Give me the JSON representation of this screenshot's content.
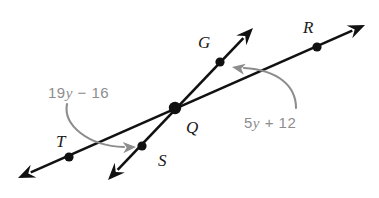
{
  "figure": {
    "type": "geometry-diagram",
    "background_color": "#ffffff"
  },
  "colors": {
    "line": "#111111",
    "point": "#111111",
    "point_label": "#1a1a1a",
    "angle_arc": "#8d8d8d",
    "angle_label": "#8d8d8d"
  },
  "points": [
    {
      "id": "G",
      "label": "G",
      "label_x": 198,
      "label_y": 48,
      "dot_x": 220,
      "dot_y": 62,
      "dot_r": 4.6
    },
    {
      "id": "R",
      "label": "R",
      "label_x": 303,
      "label_y": 33,
      "dot_x": 317,
      "dot_y": 47,
      "dot_r": 4.6
    },
    {
      "id": "Q",
      "label": "Q",
      "label_x": 186,
      "label_y": 133,
      "dot_x": 175,
      "dot_y": 108,
      "dot_r": 6.2
    },
    {
      "id": "T",
      "label": "T",
      "label_x": 56,
      "label_y": 147,
      "dot_x": 69,
      "dot_y": 157,
      "dot_r": 4.6
    },
    {
      "id": "S",
      "label": "S",
      "label_x": 158,
      "label_y": 166,
      "dot_x": 142,
      "dot_y": 146,
      "dot_r": 4.6
    }
  ],
  "lines": [
    {
      "id": "line-TR",
      "name": "line-through-T-Q-R",
      "through": [
        "T",
        "Q",
        "R"
      ],
      "x1": 18,
      "y1": 178,
      "x2": 365,
      "y2": 25,
      "arrow_start": true,
      "arrow_end": true
    },
    {
      "id": "line-SG",
      "name": "line-through-S-Q-G",
      "through": [
        "S",
        "Q",
        "G"
      ],
      "x1": 108,
      "y1": 180,
      "x2": 253,
      "y2": 28,
      "arrow_start": true,
      "arrow_end": true
    }
  ],
  "angles": [
    {
      "id": "angle-TQS",
      "expression": "19y − 16",
      "expr_head": "19",
      "expr_var": "y",
      "expr_tail": " − 16",
      "label_x": 48,
      "label_y": 98,
      "arc_path": "M 67,104 C 63,125 88,146 124,147",
      "arrow_tip_x": 136,
      "arrow_tip_y": 147,
      "arrow_rotation": -3
    },
    {
      "id": "angle-GQR",
      "expression": "5y + 12",
      "expr_head": "5",
      "expr_var": "y",
      "expr_tail": " + 12",
      "label_x": 244,
      "label_y": 128,
      "arc_path": "M 244,68 C 278,70 296,86 296,108",
      "arrow_tip_x": 232,
      "arrow_tip_y": 67,
      "arrow_rotation": 190
    }
  ]
}
